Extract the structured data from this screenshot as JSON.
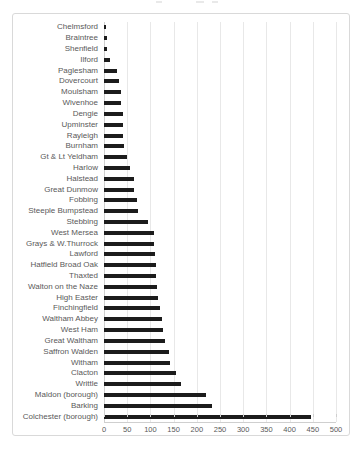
{
  "chart_data": {
    "type": "bar",
    "orientation": "horizontal",
    "categories": [
      "Chelmsford",
      "Braintree",
      "Shenfield",
      "Ilford",
      "Paglesham",
      "Dovercourt",
      "Moulsham",
      "Wivenhoe",
      "Dengie",
      "Upminster",
      "Rayleigh",
      "Burnham",
      "Gt & Lt Yeldham",
      "Harlow",
      "Halstead",
      "Great Dunmow",
      "Fobbing",
      "Steeple Bumpstead",
      "Stebbing",
      "West Mersea",
      "Grays & W.Thurrock",
      "Lawford",
      "Hatfield Broad Oak",
      "Thaxted",
      "Walton on the Naze",
      "High Easter",
      "Finchingfield",
      "Waltham Abbey",
      "West Ham",
      "Great Waltham",
      "Saffron Walden",
      "Witham",
      "Clacton",
      "Writtle",
      "Maldon (borough)",
      "Barking",
      "Colchester (borough)"
    ],
    "values": [
      5,
      7,
      7,
      12,
      28,
      33,
      36,
      36,
      40,
      42,
      42,
      44,
      50,
      57,
      65,
      65,
      72,
      74,
      95,
      107,
      107,
      109,
      112,
      113,
      115,
      116,
      121,
      124,
      128,
      132,
      140,
      142,
      155,
      165,
      220,
      233,
      447
    ],
    "x_ticks": [
      0,
      50,
      100,
      150,
      200,
      250,
      300,
      350,
      400,
      450,
      500
    ],
    "xlim": [
      0,
      500
    ],
    "xlabel": "",
    "ylabel": "",
    "grid": "vertical",
    "legend": "none",
    "bar_color": "#1c1c1c",
    "gridline_color": "#e8e8e8",
    "axis_line_color": "#cfcfcf",
    "label_color": "#595959",
    "frame_border_color": "#d9d9d9"
  }
}
